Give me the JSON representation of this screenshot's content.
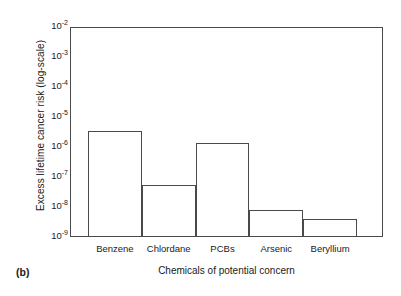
{
  "panel": {
    "label": "(b)"
  },
  "chart_data": {
    "type": "bar",
    "title": "",
    "subtitle": "",
    "xlabel": "Chemicals of potential concern",
    "ylabel": "Excess lifetime cancer risk (log-scale)",
    "yscale": "log",
    "ylim": [
      1e-09,
      0.01
    ],
    "grid": false,
    "legend": null,
    "categories": [
      "Benzene",
      "Chlordane",
      "PCBs",
      "Arsenic",
      "Beryllium"
    ],
    "values": [
      3.5e-06,
      5.5e-08,
      1.4e-06,
      8e-09,
      4e-09
    ],
    "value_labels": [
      "3.5 x 10^-6",
      "5.5 x 10^-8",
      "1.4 x 10^-6",
      "8 x 10^-9",
      "4 x 10^-9"
    ],
    "ytick_mantissa": [
      "10",
      "10",
      "10",
      "10",
      "10",
      "10",
      "10",
      "10"
    ],
    "ytick_exponents": [
      "-2",
      "-3",
      "-4",
      "-5",
      "-6",
      "-7",
      "-8",
      "-9"
    ],
    "ytick_values": [
      0.01,
      0.001,
      0.0001,
      1e-05,
      1e-06,
      1e-07,
      1e-08,
      1e-09
    ],
    "bar_style": {
      "fill": "none",
      "edge_color": "#4a4a4a"
    }
  }
}
